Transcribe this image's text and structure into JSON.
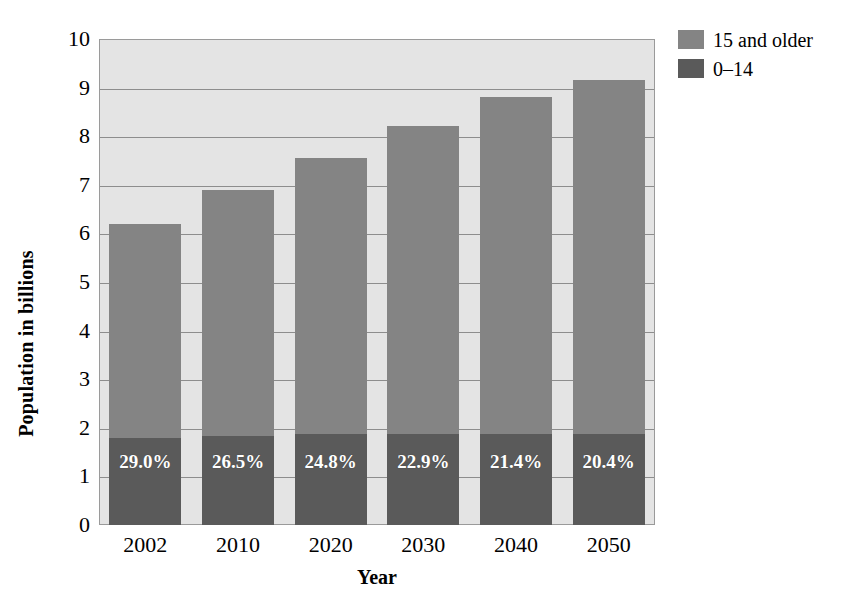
{
  "chart_data": {
    "type": "bar",
    "subtype": "stacked-vertical",
    "title": "",
    "xlabel": "Year",
    "ylabel": "Population in billions",
    "categories": [
      "2002",
      "2010",
      "2020",
      "2030",
      "2040",
      "2050"
    ],
    "ylim": [
      0,
      10
    ],
    "ytick_labels": [
      "0",
      "1",
      "2",
      "3",
      "4",
      "5",
      "6",
      "7",
      "8",
      "9",
      "10"
    ],
    "yticks": [
      0,
      1,
      2,
      3,
      4,
      5,
      6,
      7,
      8,
      9,
      10
    ],
    "grid": true,
    "grid_axis": "y",
    "legend_position": "top-right",
    "series": [
      {
        "name": "15 and older",
        "color": "#848484",
        "values": [
          4.4,
          5.07,
          5.68,
          6.32,
          6.92,
          7.28
        ]
      },
      {
        "name": "0–14",
        "color": "#5a5a5a",
        "values": [
          1.8,
          1.83,
          1.87,
          1.88,
          1.88,
          1.87
        ]
      }
    ],
    "totals": [
      6.2,
      6.9,
      7.55,
      8.2,
      8.8,
      9.15
    ],
    "data_labels": {
      "series": "0–14",
      "description": "Percent of total population aged 0–14",
      "values": [
        "29.0%",
        "26.5%",
        "24.8%",
        "22.9%",
        "21.4%",
        "20.4%"
      ]
    },
    "plot_background_color": "#e4e4e4",
    "gridline_color": "#8d8d8d",
    "axis_color": "#9a9a9a"
  },
  "axes": {
    "y_title": "Population in billions",
    "x_title": "Year",
    "y_tick_labels": [
      "10",
      "9",
      "8",
      "7",
      "6",
      "5",
      "4",
      "3",
      "2",
      "1",
      "0"
    ],
    "x_tick_labels": [
      "2002",
      "2010",
      "2020",
      "2030",
      "2040",
      "2050"
    ]
  },
  "legend": {
    "items": [
      {
        "label": "15 and older",
        "color": "#848484"
      },
      {
        "label": "0–14",
        "color": "#5a5a5a"
      }
    ]
  },
  "bar_labels": [
    "29.0%",
    "26.5%",
    "24.8%",
    "22.9%",
    "21.4%",
    "20.4%"
  ]
}
